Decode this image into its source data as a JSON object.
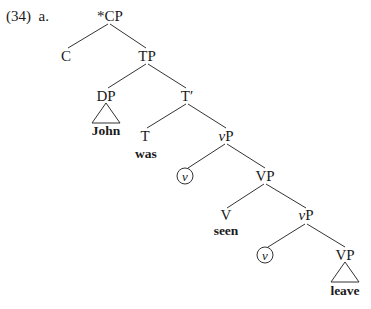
{
  "example": {
    "number": "(34)",
    "sub": "a."
  },
  "tree": {
    "nodes": {
      "cp": "*CP",
      "c": "C",
      "tp": "TP",
      "dp": "DP",
      "t_bar": "T′",
      "t": "T",
      "vp1": "P",
      "vp1_prefix": "v",
      "v_circ1": "v",
      "VP1": "VP",
      "V": "V",
      "vp2": "P",
      "vp2_prefix": "v",
      "v_circ2": "v",
      "VP2": "VP"
    },
    "words": {
      "john": "John",
      "was": "was",
      "seen": "seen",
      "leave": "leave"
    }
  }
}
